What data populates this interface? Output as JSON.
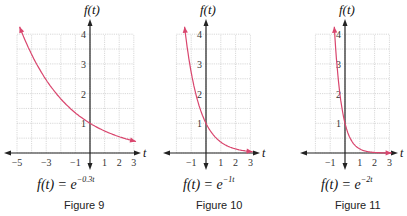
{
  "chart_data": [
    {
      "type": "line",
      "title": "Figure 9",
      "equation": "f(t) = e^(-0.3t)",
      "equation_base": "f(t) = e",
      "equation_exp": "−0.3t",
      "xlabel": "t",
      "ylabel": "f(t)",
      "xlim": [
        -5,
        3
      ],
      "ylim": [
        0,
        4
      ],
      "x_ticks": [
        "−5",
        "−3",
        "−1",
        "1",
        "2",
        "3"
      ],
      "y_ticks": [
        "1",
        "2",
        "3",
        "4"
      ],
      "grid": true,
      "series": [
        {
          "name": "e^(-0.3t)",
          "k": 0.3,
          "x": [
            -4.8,
            -4,
            -3,
            -2,
            -1,
            0,
            1,
            2,
            3
          ],
          "values": [
            4.22,
            3.32,
            2.46,
            1.82,
            1.35,
            1.0,
            0.74,
            0.55,
            0.41
          ]
        }
      ]
    },
    {
      "type": "line",
      "title": "Figure 10",
      "equation": "f(t) = e^(-1t)",
      "equation_base": "f(t) = e",
      "equation_exp": "−1t",
      "xlabel": "t",
      "ylabel": "f(t)",
      "xlim": [
        -2,
        3
      ],
      "ylim": [
        0,
        4
      ],
      "x_ticks": [
        "−1",
        "1",
        "2",
        "3"
      ],
      "y_ticks": [
        "1",
        "2",
        "3",
        "4"
      ],
      "grid": true,
      "series": [
        {
          "name": "e^(-t)",
          "k": 1,
          "x": [
            -1.45,
            -1,
            -0.5,
            0,
            0.5,
            1,
            2,
            3
          ],
          "values": [
            4.26,
            2.72,
            1.65,
            1.0,
            0.61,
            0.37,
            0.14,
            0.05
          ]
        }
      ]
    },
    {
      "type": "line",
      "title": "Figure 11",
      "equation": "f(t) = e^(-2t)",
      "equation_base": "f(t) = e",
      "equation_exp": "−2t",
      "xlabel": "t",
      "ylabel": "f(t)",
      "xlim": [
        -2,
        3
      ],
      "ylim": [
        0,
        4
      ],
      "x_ticks": [
        "−1",
        "1",
        "2",
        "3"
      ],
      "y_ticks": [
        "1",
        "2",
        "3",
        "4"
      ],
      "grid": true,
      "series": [
        {
          "name": "e^(-2t)",
          "k": 2,
          "x": [
            -0.72,
            -0.5,
            0,
            0.5,
            1,
            2,
            3
          ],
          "values": [
            4.22,
            2.72,
            1.0,
            0.37,
            0.14,
            0.02,
            0.0
          ]
        }
      ]
    }
  ],
  "colors": {
    "curve": "#d9466e",
    "axis": "#222222",
    "grid": "#c8c8c8"
  },
  "figures": [
    {
      "caption": "Figure 9"
    },
    {
      "caption": "Figure 10"
    },
    {
      "caption": "Figure 11"
    }
  ]
}
